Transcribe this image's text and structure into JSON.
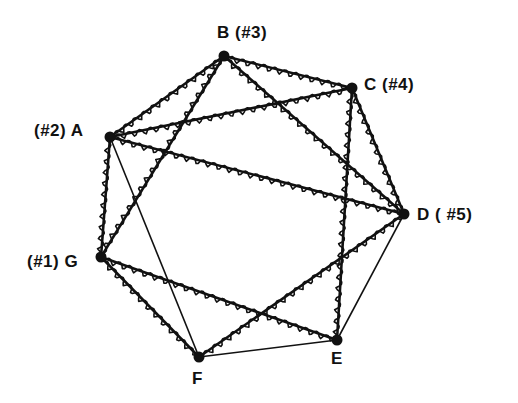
{
  "diagram": {
    "type": "graph",
    "colors": {
      "ink": "#111111",
      "background": "#ffffff"
    },
    "nodes": [
      {
        "id": "A",
        "label": "(#2)  A",
        "x": 110,
        "y": 137,
        "label_x": 34,
        "label_y": 122
      },
      {
        "id": "B",
        "label": "B  (#3)",
        "x": 224,
        "y": 56,
        "label_x": 217,
        "label_y": 24
      },
      {
        "id": "C",
        "label": "C (#4)",
        "x": 352,
        "y": 88,
        "label_x": 364,
        "label_y": 76
      },
      {
        "id": "D",
        "label": "D ( #5)",
        "x": 404,
        "y": 214,
        "label_x": 417,
        "label_y": 206
      },
      {
        "id": "E",
        "label": "E",
        "x": 337,
        "y": 340,
        "label_x": 331,
        "label_y": 350
      },
      {
        "id": "F",
        "label": "F",
        "x": 199,
        "y": 357,
        "label_x": 192,
        "label_y": 370
      },
      {
        "id": "G",
        "label": "(#1)  G",
        "x": 101,
        "y": 257,
        "label_x": 27,
        "label_y": 253
      }
    ],
    "edges": [
      {
        "from": "A",
        "to": "B",
        "style": "wavy"
      },
      {
        "from": "B",
        "to": "C",
        "style": "wavy"
      },
      {
        "from": "C",
        "to": "D",
        "style": "wavy"
      },
      {
        "from": "A",
        "to": "G",
        "style": "wavy"
      },
      {
        "from": "G",
        "to": "F",
        "style": "wavy"
      },
      {
        "from": "A",
        "to": "C",
        "style": "wavy"
      },
      {
        "from": "A",
        "to": "D",
        "style": "wavy"
      },
      {
        "from": "B",
        "to": "G",
        "style": "wavy"
      },
      {
        "from": "B",
        "to": "D",
        "style": "wavy"
      },
      {
        "from": "C",
        "to": "E",
        "style": "wavy"
      },
      {
        "from": "G",
        "to": "E",
        "style": "wavy"
      },
      {
        "from": "F",
        "to": "D",
        "style": "wavy"
      },
      {
        "from": "A",
        "to": "F",
        "style": "straight"
      },
      {
        "from": "F",
        "to": "E",
        "style": "straight"
      },
      {
        "from": "E",
        "to": "D",
        "style": "straight"
      }
    ]
  }
}
